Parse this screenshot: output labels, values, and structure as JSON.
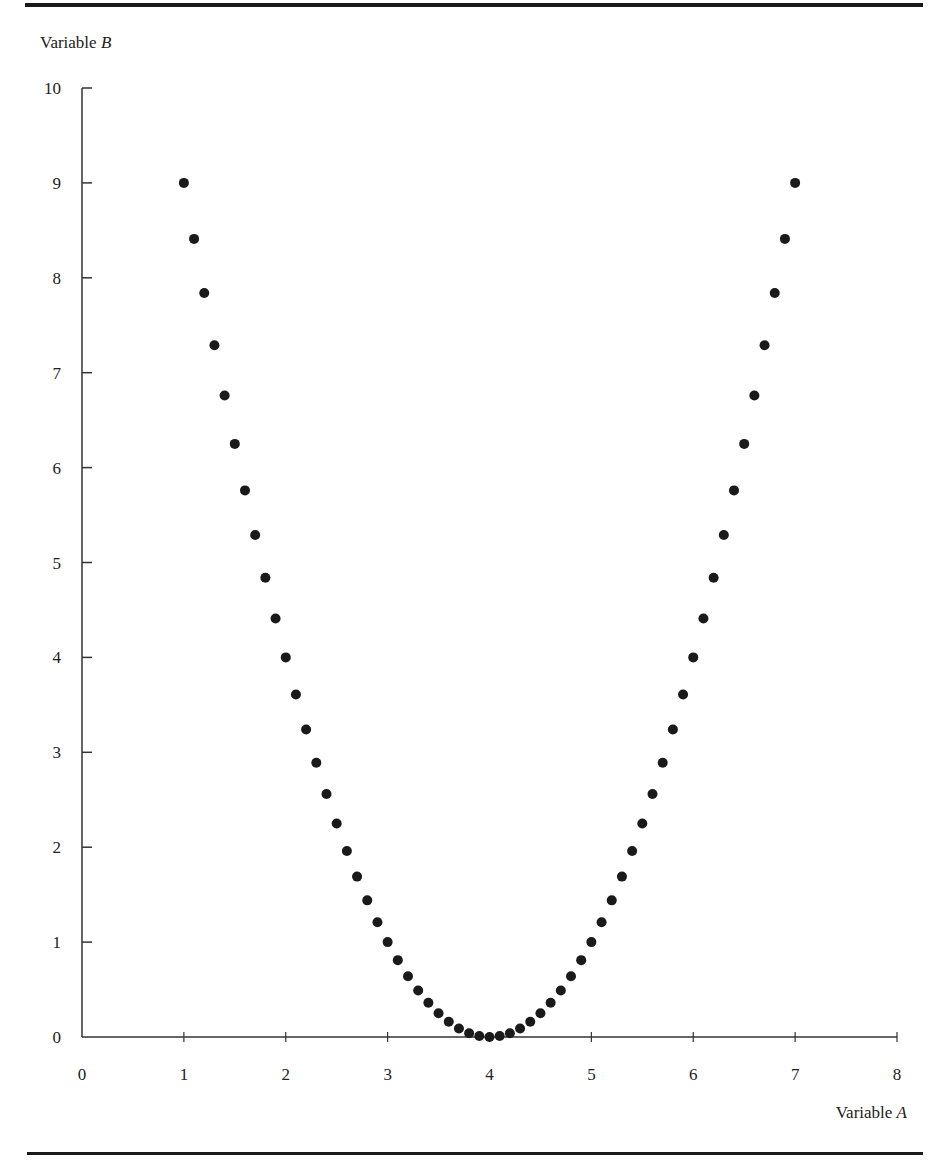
{
  "figure": {
    "y_axis_label": "Variable",
    "y_axis_var": "B",
    "x_axis_label": "Variable",
    "x_axis_var": "A"
  },
  "chart_data": {
    "type": "scatter",
    "title": "",
    "xlabel": "Variable A",
    "ylabel": "Variable B",
    "xlim": [
      0,
      8
    ],
    "ylim": [
      0,
      10
    ],
    "x_ticks": [
      0,
      1,
      2,
      3,
      4,
      5,
      6,
      7,
      8
    ],
    "y_ticks": [
      0,
      1,
      2,
      3,
      4,
      5,
      6,
      7,
      8,
      9,
      10
    ],
    "grid": false,
    "legend": null,
    "marker_color": "#1a1a1a",
    "series": [
      {
        "name": "B = (A - 4)^2",
        "x": [
          1.0,
          1.1,
          1.2,
          1.3,
          1.4,
          1.5,
          1.6,
          1.7,
          1.8,
          1.9,
          2.0,
          2.1,
          2.2,
          2.3,
          2.4,
          2.5,
          2.6,
          2.7,
          2.8,
          2.9,
          3.0,
          3.1,
          3.2,
          3.3,
          3.4,
          3.5,
          3.6,
          3.7,
          3.8,
          3.9,
          4.0,
          4.1,
          4.2,
          4.3,
          4.4,
          4.5,
          4.6,
          4.7,
          4.8,
          4.9,
          5.0,
          5.1,
          5.2,
          5.3,
          5.4,
          5.5,
          5.6,
          5.7,
          5.8,
          5.9,
          6.0,
          6.1,
          6.2,
          6.3,
          6.4,
          6.5,
          6.6,
          6.7,
          6.8,
          6.9,
          7.0
        ],
        "y": [
          9.0,
          8.41,
          7.84,
          7.29,
          6.76,
          6.25,
          5.76,
          5.29,
          4.84,
          4.41,
          4.0,
          3.61,
          3.24,
          2.89,
          2.56,
          2.25,
          1.96,
          1.69,
          1.44,
          1.21,
          1.0,
          0.81,
          0.64,
          0.49,
          0.36,
          0.25,
          0.16,
          0.09,
          0.04,
          0.01,
          0.0,
          0.01,
          0.04,
          0.09,
          0.16,
          0.25,
          0.36,
          0.49,
          0.64,
          0.81,
          1.0,
          1.21,
          1.44,
          1.69,
          1.96,
          2.25,
          2.56,
          2.89,
          3.24,
          3.61,
          4.0,
          4.41,
          4.84,
          5.29,
          5.76,
          6.25,
          6.76,
          7.29,
          7.84,
          8.41,
          9.0
        ]
      }
    ]
  }
}
